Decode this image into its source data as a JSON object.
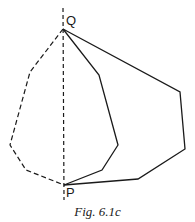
{
  "figure": {
    "caption": "Fig. 6.1c",
    "labels": {
      "top_point": "Q",
      "bottom_point": "P"
    },
    "colors": {
      "stroke": "#1a1a1a",
      "background": "#ffffff"
    },
    "points": {
      "Q": [
        63,
        29
      ],
      "P": [
        64,
        185
      ]
    },
    "paths": [
      {
        "name": "axis-line",
        "style": "dashed",
        "points": [
          [
            63,
            8
          ],
          [
            64,
            200
          ]
        ]
      },
      {
        "name": "dashed-path-left",
        "style": "dashed",
        "points": [
          [
            63,
            29
          ],
          [
            30,
            72
          ],
          [
            10,
            145
          ],
          [
            26,
            170
          ],
          [
            64,
            185
          ]
        ]
      },
      {
        "name": "solid-path-inner",
        "style": "solid",
        "points": [
          [
            63,
            29
          ],
          [
            99,
            75
          ],
          [
            118,
            145
          ],
          [
            102,
            170
          ],
          [
            64,
            185
          ]
        ]
      },
      {
        "name": "solid-path-outer",
        "style": "solid",
        "points": [
          [
            63,
            29
          ],
          [
            180,
            92
          ],
          [
            185,
            149
          ],
          [
            138,
            179
          ],
          [
            64,
            185
          ]
        ]
      }
    ]
  }
}
